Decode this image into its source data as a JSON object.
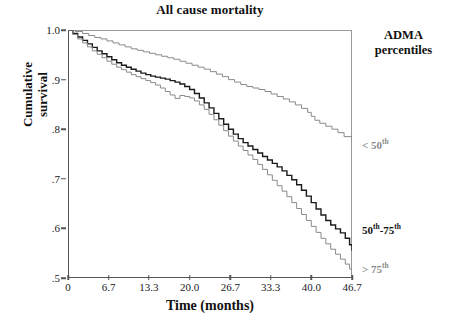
{
  "chart_data": {
    "type": "line",
    "title": "All cause mortality",
    "xlabel": "Time (months)",
    "ylabel": "Cumulative survival",
    "xlim": [
      0,
      46.7
    ],
    "ylim": [
      0.5,
      1.0
    ],
    "grid": false,
    "legend_position": "right",
    "legend_title": "ADMA percentiles",
    "xticks": [
      "0",
      "6.7",
      "13.3",
      "20.0",
      "26.7",
      "33.3",
      "40.0",
      "46.7"
    ],
    "xtick_values": [
      0,
      6.7,
      13.3,
      20.0,
      26.7,
      33.3,
      40.0,
      46.7
    ],
    "yticks": [
      "1.0",
      ".9",
      ".8",
      ".7",
      ".6",
      ".5"
    ],
    "ytick_values": [
      1.0,
      0.9,
      0.8,
      0.7,
      0.6,
      0.5
    ],
    "series": [
      {
        "name": "< 50th",
        "color": "#8a8a8a",
        "final_value": 0.775,
        "x": [
          0,
          1.2,
          2.4,
          3.4,
          4.4,
          5.4,
          6.4,
          7.4,
          8.4,
          9.4,
          10.4,
          11.4,
          12.4,
          13.4,
          14.4,
          15.4,
          16.4,
          17.4,
          18.4,
          19.4,
          20.4,
          21.4,
          22.4,
          23.4,
          24.4,
          25.4,
          26.4,
          27.4,
          28.4,
          29.4,
          30.4,
          31.4,
          32.4,
          33.4,
          34.4,
          35.4,
          36.4,
          37.4,
          38.4,
          39.4,
          40.0,
          40.6,
          41.4,
          42.4,
          43.4,
          44.4,
          45.4,
          46.7
        ],
        "y": [
          1.0,
          0.997,
          0.993,
          0.989,
          0.985,
          0.982,
          0.978,
          0.974,
          0.97,
          0.966,
          0.962,
          0.959,
          0.956,
          0.953,
          0.95,
          0.947,
          0.944,
          0.941,
          0.937,
          0.933,
          0.929,
          0.925,
          0.921,
          0.916,
          0.911,
          0.906,
          0.9,
          0.895,
          0.89,
          0.886,
          0.883,
          0.88,
          0.876,
          0.871,
          0.866,
          0.861,
          0.855,
          0.849,
          0.842,
          0.834,
          0.826,
          0.818,
          0.812,
          0.806,
          0.8,
          0.793,
          0.785,
          0.775
        ]
      },
      {
        "name": "50th-75th",
        "color": "#1a1a1a",
        "final_value": 0.555,
        "x": [
          0,
          0.8,
          1.6,
          2.4,
          3.2,
          4.0,
          4.8,
          5.6,
          6.4,
          7.2,
          8.0,
          8.8,
          9.6,
          10.4,
          11.2,
          12.0,
          12.8,
          13.6,
          14.4,
          15.2,
          16.0,
          16.8,
          17.6,
          18.4,
          19.2,
          20.0,
          20.8,
          21.6,
          22.4,
          23.2,
          24.0,
          24.8,
          25.6,
          26.4,
          27.2,
          28.0,
          28.8,
          29.6,
          30.4,
          31.2,
          32.0,
          32.8,
          33.6,
          34.4,
          35.2,
          36.0,
          36.8,
          37.6,
          38.4,
          39.2,
          40.0,
          40.8,
          41.6,
          42.4,
          43.2,
          44.0,
          44.8,
          45.6,
          46.3,
          46.7
        ],
        "y": [
          1.0,
          0.993,
          0.986,
          0.979,
          0.972,
          0.965,
          0.958,
          0.952,
          0.946,
          0.94,
          0.934,
          0.929,
          0.925,
          0.921,
          0.917,
          0.913,
          0.91,
          0.907,
          0.905,
          0.903,
          0.901,
          0.898,
          0.895,
          0.891,
          0.886,
          0.88,
          0.872,
          0.863,
          0.853,
          0.843,
          0.832,
          0.821,
          0.81,
          0.8,
          0.79,
          0.781,
          0.773,
          0.766,
          0.759,
          0.752,
          0.745,
          0.738,
          0.731,
          0.724,
          0.716,
          0.707,
          0.698,
          0.688,
          0.677,
          0.665,
          0.652,
          0.639,
          0.627,
          0.616,
          0.607,
          0.599,
          0.591,
          0.58,
          0.567,
          0.555
        ]
      },
      {
        "name": "> 75th",
        "color": "#8a8a8a",
        "final_value": 0.51,
        "x": [
          0,
          0.8,
          1.6,
          2.4,
          3.2,
          4.0,
          4.8,
          5.6,
          6.4,
          7.2,
          8.0,
          8.8,
          9.6,
          10.4,
          11.2,
          12.0,
          12.8,
          13.6,
          14.4,
          15.2,
          16.0,
          16.8,
          17.6,
          18.4,
          19.2,
          20.0,
          20.8,
          21.6,
          22.4,
          23.2,
          24.0,
          24.8,
          25.6,
          26.4,
          27.2,
          28.0,
          28.8,
          29.6,
          30.4,
          31.2,
          32.0,
          32.8,
          33.6,
          34.4,
          35.2,
          36.0,
          36.8,
          37.6,
          38.4,
          39.2,
          40.0,
          40.8,
          41.6,
          42.4,
          43.2,
          44.0,
          44.8,
          45.6,
          46.3,
          46.7
        ],
        "y": [
          1.0,
          0.991,
          0.982,
          0.974,
          0.966,
          0.958,
          0.951,
          0.944,
          0.937,
          0.931,
          0.925,
          0.92,
          0.915,
          0.91,
          0.906,
          0.902,
          0.898,
          0.894,
          0.889,
          0.883,
          0.876,
          0.869,
          0.862,
          0.868,
          0.866,
          0.863,
          0.857,
          0.849,
          0.84,
          0.83,
          0.819,
          0.808,
          0.797,
          0.786,
          0.776,
          0.766,
          0.757,
          0.748,
          0.739,
          0.729,
          0.719,
          0.708,
          0.697,
          0.686,
          0.675,
          0.664,
          0.652,
          0.64,
          0.628,
          0.616,
          0.604,
          0.592,
          0.58,
          0.569,
          0.558,
          0.548,
          0.538,
          0.528,
          0.518,
          0.51
        ]
      }
    ]
  },
  "legend": {
    "title_line1": "ADMA",
    "title_line2": "percentiles",
    "entries": [
      {
        "prefix": "< 50",
        "sup": "th",
        "suffix": ""
      },
      {
        "prefix": "50",
        "sup": "th",
        "suffix": "-75",
        "sup2": "th"
      },
      {
        "prefix": "> 75",
        "sup": "th",
        "suffix": ""
      }
    ]
  },
  "axes": {
    "y_title_line1": "Cumulative",
    "y_title_line2": "survival"
  }
}
